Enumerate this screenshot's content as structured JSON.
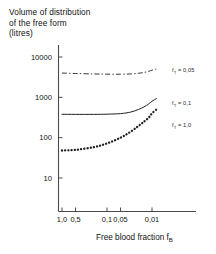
{
  "title": {
    "line1": "Volume of distribution",
    "line2": "of the free form",
    "line3": "(litres)"
  },
  "axes": {
    "x_title_main": "Free blood fraction f",
    "x_title_sub": "B",
    "y_ticks": [
      "10000",
      "1000",
      "100",
      "10"
    ],
    "x_ticks": [
      "1,0",
      "0,5",
      "0,1",
      "0,05",
      "0,01"
    ]
  },
  "legends": [
    {
      "var": "f",
      "sub": "T",
      "eq": " = 0,05"
    },
    {
      "var": "f",
      "sub": "T",
      "eq": " = 0,1"
    },
    {
      "var": "f",
      "sub": "T",
      "eq": " = 1,0"
    }
  ],
  "chart_data": {
    "type": "line",
    "title": "Volume of distribution of the free form (litres)",
    "xlabel": "Free blood fraction fB",
    "ylabel": "Volume of distribution of the free form (litres)",
    "xscale": "log-reversed",
    "yscale": "log",
    "xlim": [
      1.0,
      0.008
    ],
    "ylim": [
      5,
      20000
    ],
    "grid": false,
    "legend_position": "right-outside",
    "x_tick_values": [
      1.0,
      0.5,
      0.1,
      0.05,
      0.01
    ],
    "x_tick_labels": [
      "1,0",
      "0,5",
      "0,1",
      "0,05",
      "0,01"
    ],
    "y_tick_values": [
      10000,
      1000,
      100,
      10
    ],
    "y_tick_labels": [
      "10000",
      "1000",
      "100",
      "10"
    ],
    "series": [
      {
        "name": "fT = 0,05",
        "style": "dash-dot",
        "x": [
          1.0,
          0.5,
          0.2,
          0.1,
          0.05,
          0.03,
          0.02,
          0.015,
          0.012,
          0.01,
          0.008
        ],
        "values": [
          4000,
          3900,
          3800,
          3750,
          3750,
          3800,
          3950,
          4150,
          4400,
          4700,
          5000
        ]
      },
      {
        "name": "fT = 0,1",
        "style": "solid",
        "x": [
          1.0,
          0.5,
          0.2,
          0.1,
          0.05,
          0.03,
          0.02,
          0.015,
          0.012,
          0.01,
          0.008
        ],
        "values": [
          380,
          378,
          378,
          382,
          395,
          430,
          500,
          580,
          680,
          800,
          930
        ]
      },
      {
        "name": "fT = 1,0",
        "style": "dotted",
        "x": [
          1.0,
          0.5,
          0.2,
          0.1,
          0.05,
          0.03,
          0.02,
          0.015,
          0.012,
          0.01,
          0.008
        ],
        "values": [
          48,
          50,
          58,
          72,
          100,
          140,
          195,
          250,
          310,
          400,
          500
        ]
      }
    ]
  }
}
